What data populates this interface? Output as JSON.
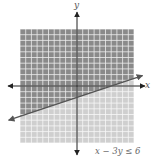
{
  "chart_data": {
    "type": "inequality-graph",
    "title": "",
    "inequality": "x − 3y ≤ 6",
    "boundary_line": {
      "equation": "x − 3y = 6",
      "slope": 0.3333,
      "y_intercept": -2,
      "x_intercept": 6,
      "style": "solid",
      "arrows": "both"
    },
    "shaded_region": "above line (contains origin)",
    "xlabel": "x",
    "ylabel": "y",
    "xlim": [
      -10,
      10
    ],
    "ylim": [
      -10,
      10
    ],
    "grid": true,
    "grid_step": 1,
    "colors": {
      "shaded": "#8a8a8a",
      "unshaded": "#cfcfcf",
      "grid_line": "#ffffff",
      "axis": "#222222",
      "boundary": "#555555"
    }
  },
  "labels": {
    "x_axis": "x",
    "y_axis": "y",
    "inequality": "x − 3y ≤ 6"
  }
}
